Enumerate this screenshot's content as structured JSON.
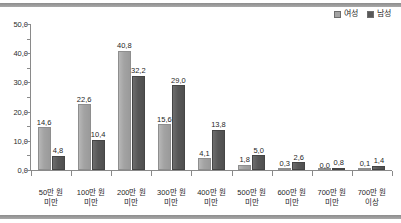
{
  "chart_data": {
    "type": "bar",
    "title": "",
    "subtitle": "",
    "xlabel": "",
    "ylabel": "",
    "ylim": [
      0.0,
      50.0
    ],
    "y_ticks": [
      "0,0",
      "10,0",
      "20,0",
      "30,0",
      "40,0",
      "50,0"
    ],
    "y_tick_values": [
      0.0,
      10.0,
      20.0,
      30.0,
      40.0,
      50.0
    ],
    "y_minor_tick_values": [
      5.0,
      15.0,
      25.0,
      35.0,
      45.0
    ],
    "decimal_separator": ",",
    "grid": false,
    "legend_position": "top-right",
    "categories": [
      "50만 원 미만",
      "100만 원 미만",
      "200만 원 미만",
      "300만 원 미만",
      "400만 원 미만",
      "500만 원 미만",
      "600만 원 미만",
      "700만 원 미만",
      "700만 원 이상"
    ],
    "category_lines": [
      [
        "50만 원",
        "미만"
      ],
      [
        "100만 원",
        "미만"
      ],
      [
        "200만 원",
        "미만"
      ],
      [
        "300만 원",
        "미만"
      ],
      [
        "400만 원",
        "미만"
      ],
      [
        "500만 원",
        "미만"
      ],
      [
        "600만 원",
        "미만"
      ],
      [
        "700만 원",
        "미만"
      ],
      [
        "700만 원",
        "이상"
      ]
    ],
    "series": [
      {
        "name": "여성",
        "color": "#a3a3a3",
        "values": [
          14.6,
          22.6,
          40.8,
          15.6,
          4.1,
          1.8,
          0.3,
          0.0,
          0.1
        ],
        "labels": [
          "14,6",
          "22,6",
          "40,8",
          "15,6",
          "4,1",
          "1,8",
          "0,3",
          "0,0",
          "0,1"
        ]
      },
      {
        "name": "남성",
        "color": "#585858",
        "values": [
          4.8,
          10.4,
          32.2,
          29.0,
          13.8,
          5.0,
          2.6,
          0.8,
          1.4
        ],
        "labels": [
          "4,8",
          "10,4",
          "32,2",
          "29,0",
          "13,8",
          "5,0",
          "2,6",
          "0,8",
          "1,4"
        ]
      }
    ]
  },
  "legend": {
    "items": [
      {
        "label": "여성",
        "color": "#a3a3a3"
      },
      {
        "label": "남성",
        "color": "#585858"
      }
    ]
  }
}
